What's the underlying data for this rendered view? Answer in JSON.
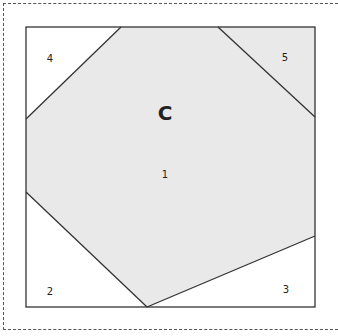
{
  "diagram": {
    "title": "C",
    "colors": {
      "shaded": "#e9e9e9",
      "unshaded": "#ffffff",
      "stroke": "#333333",
      "frame_dash": "#555555"
    },
    "square": {
      "x": 26,
      "y": 27,
      "width": 289,
      "height": 280
    },
    "regions": [
      {
        "id": "1",
        "label": "1",
        "shaded": true,
        "label_pos": [
          165,
          175
        ]
      },
      {
        "id": "2",
        "label": "2",
        "shaded": false,
        "label_pos": [
          50,
          292
        ]
      },
      {
        "id": "3",
        "label": "3",
        "shaded": false,
        "label_pos": [
          286,
          290
        ]
      },
      {
        "id": "4",
        "label": "4",
        "shaded": false,
        "label_pos": [
          50,
          59
        ]
      },
      {
        "id": "5",
        "label": "5",
        "shaded": true,
        "label_pos": [
          285,
          58
        ]
      }
    ]
  }
}
